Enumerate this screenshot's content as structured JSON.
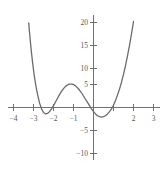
{
  "chart_data": {
    "type": "line",
    "title": "",
    "subtitle": "",
    "xlabel": "",
    "ylabel": "",
    "xlim": [
      -4.2,
      3.35
    ],
    "ylim": [
      -12.5,
      23.5
    ],
    "grid": false,
    "legend": null,
    "axes": {
      "x_axis_value": 0,
      "y_axis_value": 0,
      "x_ticks": [
        -4,
        -3,
        -2,
        -1,
        1,
        2,
        3
      ],
      "x_tick_labels": [
        "−4",
        "−3",
        "−2",
        "−1",
        "",
        "2",
        "3"
      ],
      "y_ticks": [
        -10,
        -5,
        5,
        10,
        15,
        20
      ],
      "y_tick_labels": [
        "−10",
        "−5",
        "5",
        "10",
        "15",
        "20"
      ]
    },
    "series": [
      {
        "name": "curve",
        "color": "#6b6b6b",
        "linewidth": 1.3,
        "roots": [
          -3,
          -1,
          2
        ],
        "local_max": {
          "x": -2,
          "y": 6
        },
        "local_min": {
          "x": 0.4,
          "y": -8
        },
        "x": [
          -3.32,
          -3.28,
          -3.24,
          -3.2,
          -3.16,
          -3.12,
          -3.08,
          -3.04,
          -3.0,
          -2.96,
          -2.92,
          -2.88,
          -2.84,
          -2.8,
          -2.7,
          -2.6,
          -2.5,
          -2.4,
          -2.3,
          -2.2,
          -2.1,
          -2.0,
          -1.9,
          -1.8,
          -1.7,
          -1.6,
          -1.5,
          -1.4,
          -1.3,
          -1.2,
          -1.1,
          -1.0,
          -0.9,
          -0.8,
          -0.7,
          -0.6,
          -0.5,
          -0.4,
          -0.3,
          -0.2,
          -0.1,
          0.0,
          0.1,
          0.2,
          0.3,
          0.4,
          0.5,
          0.6,
          0.7,
          0.8,
          0.9,
          1.0,
          1.1,
          1.2,
          1.3,
          1.4,
          1.5,
          1.6,
          1.7,
          1.8,
          1.9,
          2.0,
          2.1,
          2.2,
          2.3,
          2.4,
          2.5,
          2.6,
          2.7,
          2.8,
          2.9,
          3.0,
          3.05,
          3.1,
          3.15,
          3.2
        ],
        "y": [
          22.9,
          20.6,
          18.4,
          16.4,
          14.5,
          12.7,
          11.1,
          9.6,
          8.2,
          6.9,
          5.8,
          4.7,
          3.8,
          2.9,
          1.0,
          -0.3,
          -1.1,
          -1.4,
          -1.3,
          -0.9,
          -0.3,
          0.4,
          1.2,
          2.0,
          2.8,
          3.5,
          4.1,
          4.6,
          4.9,
          5.1,
          5.1,
          5.0,
          4.7,
          4.3,
          3.8,
          3.2,
          2.5,
          1.8,
          1.1,
          0.4,
          -0.3,
          -0.9,
          -1.4,
          -1.8,
          -2.0,
          -2.1,
          -2.0,
          -1.8,
          -1.4,
          -0.9,
          -0.3,
          0.5,
          1.5,
          2.7,
          4.0,
          5.5,
          7.2,
          9.1,
          11.2,
          13.5,
          16.0,
          18.7,
          21.6,
          24.7,
          28.0,
          31.5,
          35.2,
          39.1,
          43.2,
          47.5,
          52.0,
          56.7,
          59.1,
          61.6,
          64.1,
          66.7
        ]
      }
    ]
  },
  "figure": {
    "background_color": "#ffffff",
    "axis_color": "#707070",
    "curve_color": "#6b6b6b",
    "tick_label_color": "#595959"
  }
}
